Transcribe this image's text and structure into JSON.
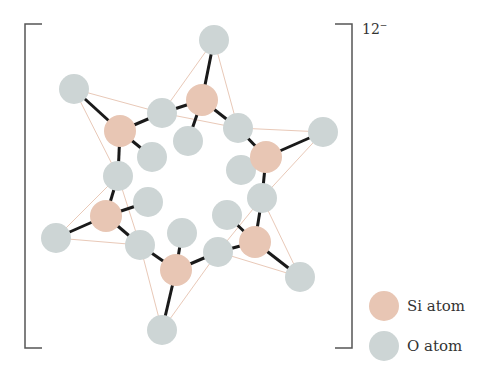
{
  "title_charge": {
    "value": "12",
    "sign": "−"
  },
  "colors": {
    "si": "#e8c6b4",
    "o": "#cdd5d5",
    "bond": "#1a1a1a",
    "edge": "#e9c9b8",
    "bracket": "#555555"
  },
  "legend": [
    {
      "label": "Si atom",
      "color": "#e8c6b4"
    },
    {
      "label": "O atom",
      "color": "#cdd5d5"
    }
  ],
  "atoms": {
    "si": [
      [
        202,
        100
      ],
      [
        266,
        157
      ],
      [
        120,
        131
      ],
      [
        106,
        216
      ],
      [
        255,
        242
      ],
      [
        176,
        270
      ]
    ],
    "o": [
      [
        214,
        40
      ],
      [
        74,
        89
      ],
      [
        162,
        113
      ],
      [
        238,
        128
      ],
      [
        323,
        132
      ],
      [
        188,
        141
      ],
      [
        152,
        157
      ],
      [
        118,
        176
      ],
      [
        148,
        202
      ],
      [
        241,
        170
      ],
      [
        262,
        198
      ],
      [
        56,
        238
      ],
      [
        140,
        245
      ],
      [
        182,
        233
      ],
      [
        227,
        215
      ],
      [
        218,
        252
      ],
      [
        300,
        277
      ],
      [
        162,
        330
      ]
    ]
  },
  "bonds": [
    [
      [
        202,
        100
      ],
      [
        214,
        40
      ]
    ],
    [
      [
        202,
        100
      ],
      [
        162,
        113
      ]
    ],
    [
      [
        202,
        100
      ],
      [
        238,
        128
      ]
    ],
    [
      [
        202,
        100
      ],
      [
        188,
        141
      ]
    ],
    [
      [
        266,
        157
      ],
      [
        238,
        128
      ]
    ],
    [
      [
        266,
        157
      ],
      [
        323,
        132
      ]
    ],
    [
      [
        266,
        157
      ],
      [
        241,
        170
      ]
    ],
    [
      [
        266,
        157
      ],
      [
        262,
        198
      ]
    ],
    [
      [
        120,
        131
      ],
      [
        74,
        89
      ]
    ],
    [
      [
        120,
        131
      ],
      [
        162,
        113
      ]
    ],
    [
      [
        120,
        131
      ],
      [
        152,
        157
      ]
    ],
    [
      [
        120,
        131
      ],
      [
        118,
        176
      ]
    ],
    [
      [
        106,
        216
      ],
      [
        118,
        176
      ]
    ],
    [
      [
        106,
        216
      ],
      [
        148,
        202
      ]
    ],
    [
      [
        106,
        216
      ],
      [
        56,
        238
      ]
    ],
    [
      [
        106,
        216
      ],
      [
        140,
        245
      ]
    ],
    [
      [
        255,
        242
      ],
      [
        262,
        198
      ]
    ],
    [
      [
        255,
        242
      ],
      [
        227,
        215
      ]
    ],
    [
      [
        255,
        242
      ],
      [
        218,
        252
      ]
    ],
    [
      [
        255,
        242
      ],
      [
        300,
        277
      ]
    ],
    [
      [
        176,
        270
      ],
      [
        140,
        245
      ]
    ],
    [
      [
        176,
        270
      ],
      [
        182,
        233
      ]
    ],
    [
      [
        176,
        270
      ],
      [
        218,
        252
      ]
    ],
    [
      [
        176,
        270
      ],
      [
        162,
        330
      ]
    ]
  ],
  "edges": [
    [
      [
        214,
        40
      ],
      [
        162,
        113
      ]
    ],
    [
      [
        214,
        40
      ],
      [
        238,
        128
      ]
    ],
    [
      [
        74,
        89
      ],
      [
        162,
        113
      ]
    ],
    [
      [
        74,
        89
      ],
      [
        118,
        176
      ]
    ],
    [
      [
        323,
        132
      ],
      [
        238,
        128
      ]
    ],
    [
      [
        323,
        132
      ],
      [
        262,
        198
      ]
    ],
    [
      [
        56,
        238
      ],
      [
        118,
        176
      ]
    ],
    [
      [
        56,
        238
      ],
      [
        140,
        245
      ]
    ],
    [
      [
        300,
        277
      ],
      [
        262,
        198
      ]
    ],
    [
      [
        300,
        277
      ],
      [
        218,
        252
      ]
    ],
    [
      [
        162,
        330
      ],
      [
        140,
        245
      ]
    ],
    [
      [
        162,
        330
      ],
      [
        218,
        252
      ]
    ],
    [
      [
        162,
        113
      ],
      [
        238,
        128
      ]
    ],
    [
      [
        118,
        176
      ],
      [
        140,
        245
      ]
    ],
    [
      [
        262,
        198
      ],
      [
        218,
        252
      ]
    ]
  ]
}
